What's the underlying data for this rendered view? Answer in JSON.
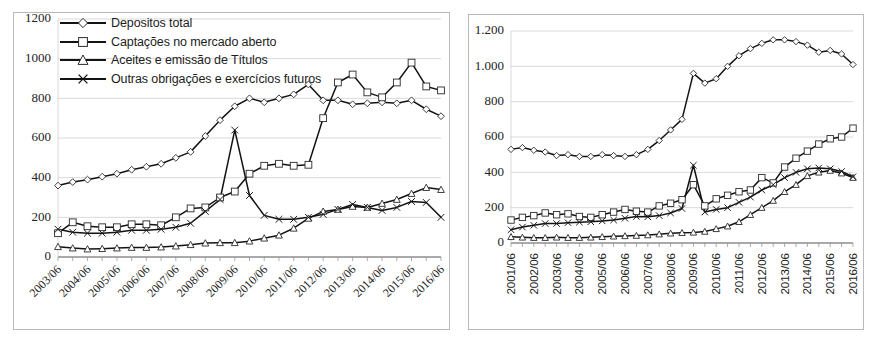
{
  "figure": {
    "background_color": "#ffffff",
    "line_color": "#131313",
    "grid_color": "#c8c8c8",
    "panel_border_color": "#b9b9b9",
    "top_partial_text": ""
  },
  "legend": {
    "items": [
      {
        "label": "Depositos total",
        "marker": "diamond"
      },
      {
        "label": "Captações no mercado aberto",
        "marker": "square"
      },
      {
        "label": "Aceites e emissão de Títulos",
        "marker": "triangle"
      },
      {
        "label": "Outras obrigações e exercícios futuros",
        "marker": "x"
      }
    ]
  },
  "chart_data": [
    {
      "id": "left",
      "type": "line",
      "title": "",
      "xlabel": "",
      "ylabel": "",
      "ylim": [
        0,
        1200
      ],
      "yticks": [
        0,
        200,
        400,
        600,
        800,
        1000,
        1200
      ],
      "ytick_labels": [
        "0",
        "200",
        "400",
        "600",
        "800",
        "1000",
        "1200"
      ],
      "grid": true,
      "legend_position": "top-left",
      "x": [
        "2003/06",
        "2003/12",
        "2004/06",
        "2004/12",
        "2005/06",
        "2005/12",
        "2006/06",
        "2006/12",
        "2007/06",
        "2007/12",
        "2008/06",
        "2008/12",
        "2009/06",
        "2009/12",
        "2010/06",
        "2010/12",
        "2011/06",
        "2011/12",
        "2012/06",
        "2012/12",
        "2013/06",
        "2013/12",
        "2014/06",
        "2014/12",
        "2015/06",
        "2015/12",
        "2016/06"
      ],
      "xtick_labels": [
        "2003/06",
        "2004/06",
        "2005/06",
        "2006/06",
        "2007/06",
        "2008/06",
        "2009/06",
        "2010/06",
        "2011/06",
        "2012/06",
        "2013/06",
        "2014/06",
        "2015/06",
        "2016/06"
      ],
      "series": [
        {
          "name": "Depositos total",
          "marker": "diamond",
          "values": [
            360,
            378,
            390,
            405,
            420,
            440,
            455,
            470,
            500,
            530,
            610,
            690,
            760,
            800,
            780,
            800,
            820,
            870,
            790,
            790,
            770,
            775,
            780,
            775,
            790,
            745,
            710
          ]
        },
        {
          "name": "Captações no mercado aberto",
          "marker": "square",
          "values": [
            120,
            175,
            155,
            150,
            150,
            165,
            165,
            160,
            200,
            245,
            250,
            300,
            330,
            420,
            460,
            470,
            460,
            465,
            700,
            880,
            920,
            830,
            805,
            880,
            980,
            860,
            840
          ]
        },
        {
          "name": "Aceites e emissão de Títulos",
          "marker": "triangle",
          "values": [
            52,
            45,
            40,
            42,
            45,
            48,
            48,
            50,
            55,
            62,
            70,
            72,
            72,
            80,
            95,
            110,
            145,
            195,
            230,
            240,
            255,
            250,
            270,
            290,
            320,
            350,
            340
          ]
        },
        {
          "name": "Outras obrigações e exercícios futuros",
          "marker": "x",
          "values": [
            140,
            125,
            120,
            120,
            125,
            135,
            135,
            140,
            150,
            170,
            230,
            290,
            640,
            310,
            210,
            190,
            190,
            200,
            215,
            240,
            265,
            250,
            235,
            250,
            280,
            275,
            200
          ]
        }
      ]
    },
    {
      "id": "right",
      "type": "line",
      "title": "",
      "xlabel": "",
      "ylabel": "",
      "ylim": [
        0,
        1200
      ],
      "yticks": [
        0,
        200,
        400,
        600,
        800,
        1000,
        1200
      ],
      "ytick_labels": [
        "0",
        "200",
        "400",
        "600",
        "800",
        "1.000",
        "1.200"
      ],
      "grid": true,
      "legend_position": "none",
      "x": [
        "2001/06",
        "2001/12",
        "2002/06",
        "2002/12",
        "2003/06",
        "2003/12",
        "2004/06",
        "2004/12",
        "2005/06",
        "2005/12",
        "2006/06",
        "2006/12",
        "2007/06",
        "2007/12",
        "2008/06",
        "2008/12",
        "2009/06",
        "2009/12",
        "2010/06",
        "2010/12",
        "2011/06",
        "2011/12",
        "2012/06",
        "2012/12",
        "2013/06",
        "2013/12",
        "2014/06",
        "2014/12",
        "2015/06",
        "2015/12",
        "2016/06"
      ],
      "xtick_labels": [
        "2001/06",
        "2002/06",
        "2003/06",
        "2004/06",
        "2005/06",
        "2006/06",
        "2007/06",
        "2008/06",
        "2009/06",
        "2010/06",
        "2011/06",
        "2012/06",
        "2013/06",
        "2014/06",
        "2015/06",
        "2016/06"
      ],
      "series": [
        {
          "name": "Depositos total",
          "marker": "diamond",
          "values": [
            530,
            540,
            525,
            515,
            495,
            500,
            490,
            490,
            500,
            495,
            490,
            500,
            530,
            580,
            640,
            700,
            960,
            905,
            930,
            1000,
            1060,
            1100,
            1130,
            1150,
            1150,
            1140,
            1120,
            1080,
            1090,
            1070,
            1010
          ]
        },
        {
          "name": "Captações no mercado aberto",
          "marker": "square",
          "values": [
            130,
            145,
            155,
            170,
            160,
            165,
            150,
            145,
            160,
            175,
            190,
            180,
            175,
            210,
            225,
            245,
            330,
            210,
            250,
            270,
            290,
            300,
            370,
            340,
            430,
            480,
            520,
            560,
            590,
            600,
            650
          ]
        },
        {
          "name": "Aceites e emissão de Títulos",
          "marker": "triangle",
          "values": [
            35,
            32,
            30,
            30,
            32,
            30,
            30,
            32,
            35,
            38,
            40,
            42,
            45,
            50,
            55,
            58,
            60,
            65,
            80,
            95,
            120,
            160,
            200,
            240,
            290,
            330,
            380,
            400,
            410,
            395,
            370
          ]
        },
        {
          "name": "Outras obrigações e exercícios futuros",
          "marker": "x",
          "values": [
            75,
            90,
            100,
            110,
            110,
            115,
            118,
            120,
            125,
            130,
            140,
            150,
            148,
            155,
            170,
            195,
            440,
            175,
            190,
            200,
            230,
            260,
            300,
            330,
            370,
            400,
            420,
            425,
            420,
            405,
            375
          ]
        }
      ]
    }
  ]
}
